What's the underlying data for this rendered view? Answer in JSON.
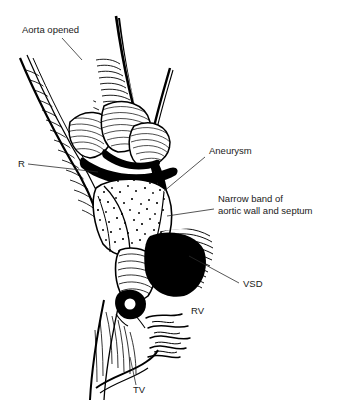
{
  "figure": {
    "kind": "medical-line-illustration",
    "style": "black-and-white pen-and-ink hatching and stipple",
    "background_color": "#ffffff",
    "ink_color": "#000000",
    "label_color": "#1a1a1a",
    "width": 337,
    "height": 407
  },
  "labels": [
    {
      "id": "aorta-opened",
      "text": "Aorta opened",
      "x": 22,
      "y": 33,
      "anchor": "start",
      "leader": {
        "x1": 62,
        "y1": 38,
        "x2": 82,
        "y2": 60
      }
    },
    {
      "id": "r-cusp",
      "text": "R",
      "x": 18,
      "y": 167,
      "anchor": "start",
      "leader": {
        "x1": 28,
        "y1": 164,
        "x2": 98,
        "y2": 172
      }
    },
    {
      "id": "aneurysm",
      "text": "Aneurysm",
      "x": 209,
      "y": 154,
      "anchor": "start",
      "leader": {
        "x1": 205,
        "y1": 157,
        "x2": 163,
        "y2": 192
      }
    },
    {
      "id": "narrow-band-line1",
      "text": "Narrow band of",
      "x": 218,
      "y": 202,
      "anchor": "start",
      "leader": null
    },
    {
      "id": "narrow-band-line2",
      "text": "aortic wall and septum",
      "x": 218,
      "y": 214,
      "anchor": "start",
      "leader": {
        "x1": 214,
        "y1": 209,
        "x2": 167,
        "y2": 216
      }
    },
    {
      "id": "vsd",
      "text": "VSD",
      "x": 243,
      "y": 287,
      "anchor": "start",
      "leader": {
        "x1": 239,
        "y1": 283,
        "x2": 189,
        "y2": 256
      }
    },
    {
      "id": "rv",
      "text": "RV",
      "x": 191,
      "y": 314,
      "anchor": "start",
      "leader": null
    },
    {
      "id": "tv",
      "text": "TV",
      "x": 133,
      "y": 393,
      "anchor": "start",
      "leader": {
        "x1": 136,
        "y1": 385,
        "x2": 130,
        "y2": 357
      }
    }
  ],
  "structures": [
    {
      "id": "aorta-wall-left",
      "name": "left cut edge of opened aorta"
    },
    {
      "id": "aorta-wall-right",
      "name": "right cut edge of opened aorta"
    },
    {
      "id": "aortic-cusps",
      "name": "aortic valve cusps"
    },
    {
      "id": "aneurysm-sac",
      "name": "stippled aneurysm sac"
    },
    {
      "id": "narrow-band",
      "name": "narrow band of aortic wall and septum"
    },
    {
      "id": "vsd-opening",
      "name": "ventricular septal defect opening"
    },
    {
      "id": "rv-trabeculae",
      "name": "right ventricular trabeculations"
    },
    {
      "id": "tv-leaflet",
      "name": "tricuspid valve leaflet"
    }
  ]
}
